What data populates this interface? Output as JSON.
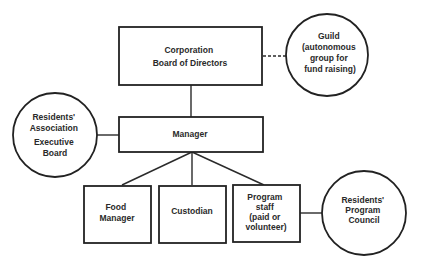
{
  "diagram": {
    "type": "organization-chart",
    "colors": {
      "line": "#222222",
      "text": "#2a2a2a",
      "background": "#ffffff"
    },
    "nodes": {
      "board": {
        "shape": "rectangle",
        "lines": [
          "Corporation",
          "Board of Directors"
        ]
      },
      "guild": {
        "shape": "circle",
        "lines": [
          "Guild",
          "(autonomous",
          "group for",
          "fund raising)"
        ]
      },
      "residents_association": {
        "shape": "circle",
        "lines": [
          "Residents'",
          "Association",
          "Executive",
          "Board"
        ]
      },
      "manager": {
        "shape": "rectangle",
        "lines": [
          "Manager"
        ]
      },
      "food_manager": {
        "shape": "rectangle",
        "lines": [
          "Food",
          "Manager"
        ]
      },
      "custodian": {
        "shape": "rectangle",
        "lines": [
          "Custodian"
        ]
      },
      "program_staff": {
        "shape": "rectangle",
        "lines": [
          "Program",
          "staff",
          "(paid or",
          "volunteer)"
        ]
      },
      "program_council": {
        "shape": "circle",
        "lines": [
          "Residents'",
          "Program",
          "Council"
        ]
      }
    },
    "edges": [
      {
        "from": "board",
        "to": "guild",
        "style": "dashed"
      },
      {
        "from": "board",
        "to": "manager",
        "style": "solid"
      },
      {
        "from": "residents_association",
        "to": "manager",
        "style": "solid"
      },
      {
        "from": "manager",
        "to": "food_manager",
        "style": "solid"
      },
      {
        "from": "manager",
        "to": "custodian",
        "style": "solid"
      },
      {
        "from": "manager",
        "to": "program_staff",
        "style": "solid"
      },
      {
        "from": "program_staff",
        "to": "program_council",
        "style": "solid"
      }
    ]
  }
}
